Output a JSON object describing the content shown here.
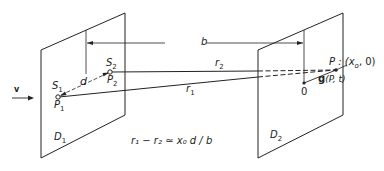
{
  "diagram": {
    "velocity_label": "v",
    "screen1_label": "D",
    "screen1_sub": "1",
    "screen2_label": "D",
    "screen2_sub": "2",
    "separation_label": "b",
    "slit_distance_label": "d",
    "source1_label": "S",
    "source1_sub": "1",
    "source2_label": "S",
    "source2_sub": "2",
    "point1_label": "P",
    "point1_sub": "1",
    "point2_label": "P",
    "point2_sub": "2",
    "path1_label": "r",
    "path1_sub": "1",
    "path2_label": "r",
    "path2_sub": "2",
    "origin_label": "0",
    "observation_point_label": "P : (x",
    "observation_point_sub": "o",
    "observation_point_tail": ", 0)",
    "field_label_bold": "g",
    "field_label_args": "(P, t)",
    "equation": "r₁ − r₂ ≃ x₀ d / b",
    "colors": {
      "stroke": "#222222",
      "background": "#ffffff"
    }
  }
}
